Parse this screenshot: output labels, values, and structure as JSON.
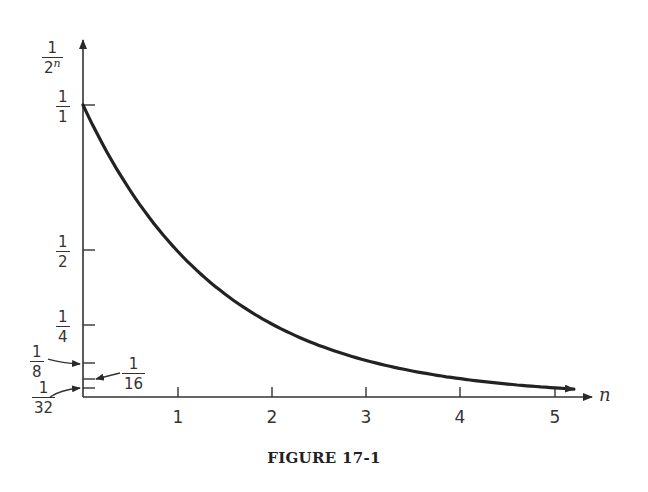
{
  "figure": {
    "caption": "FIGURE 17-1",
    "y_axis_label": {
      "num": "1",
      "den_base": "2",
      "den_exp": "n"
    },
    "x_axis_label": "n",
    "y_ticks": [
      {
        "num": "1",
        "den": "1",
        "value": 1
      },
      {
        "num": "1",
        "den": "2",
        "value": 0.5
      },
      {
        "num": "1",
        "den": "4",
        "value": 0.25
      },
      {
        "num": "1",
        "den": "8",
        "value": 0.125
      },
      {
        "num": "1",
        "den": "16",
        "value": 0.0625
      },
      {
        "num": "1",
        "den": "32",
        "value": 0.03125
      }
    ],
    "x_ticks": [
      "1",
      "2",
      "3",
      "4",
      "5"
    ]
  },
  "chart_data": {
    "type": "line",
    "title": "FIGURE 17-1",
    "xlabel": "n",
    "ylabel": "1/2^n",
    "x": [
      0,
      0.5,
      1,
      1.5,
      2,
      2.5,
      3,
      3.5,
      4,
      4.5,
      5
    ],
    "series": [
      {
        "name": "1/2^n",
        "values": [
          1,
          0.7071,
          0.5,
          0.3536,
          0.25,
          0.1768,
          0.125,
          0.0884,
          0.0625,
          0.0442,
          0.03125
        ]
      }
    ],
    "xlim": [
      0,
      5.3
    ],
    "ylim": [
      0,
      1.3
    ],
    "y_tick_labels": [
      "1/1",
      "1/2",
      "1/4",
      "1/8",
      "1/16",
      "1/32"
    ],
    "x_tick_labels": [
      "1",
      "2",
      "3",
      "4",
      "5"
    ],
    "grid": false,
    "legend": "none",
    "annotations": [
      "arrows pointing to 1/8, 1/16, 1/32 ticks",
      "arrowhead at curve end near n=5"
    ]
  }
}
